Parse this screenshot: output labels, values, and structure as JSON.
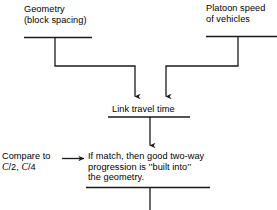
{
  "diagram": {
    "type": "flowchart",
    "stroke_color": "#1a1a1a",
    "background_color": "#ffffff",
    "nodes": {
      "geometry": {
        "line1": "Geometry",
        "line2": "(block spacing)"
      },
      "platoon": {
        "line1": "Platoon speed",
        "line2": "of vehicles"
      },
      "link_travel_time": {
        "line1": "Link travel time"
      },
      "compare": {
        "line1": "Compare to",
        "line2_prefix": "",
        "line2_var1": "C",
        "line2_mid": "/2, ",
        "line2_var2": "C",
        "line2_suffix": "/4"
      },
      "if_match": {
        "line1": "If match, then good two-way",
        "line2": "progression is ’’built into’’",
        "line3": "the geometry."
      }
    },
    "edges": [
      {
        "name": "geometry-to-link-travel-time",
        "style": "elbow",
        "arrowhead": "down"
      },
      {
        "name": "platoon-to-link-travel-time",
        "style": "elbow",
        "arrowhead": "down"
      },
      {
        "name": "link-travel-time-to-if-match",
        "style": "straight",
        "arrowhead": "down"
      },
      {
        "name": "compare-to-if-match",
        "style": "straight",
        "arrowhead": "right"
      },
      {
        "name": "if-match-to-next",
        "style": "straight",
        "arrowhead": "none"
      }
    ]
  }
}
